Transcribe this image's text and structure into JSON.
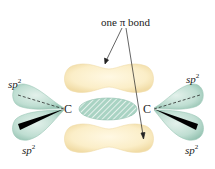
{
  "diagram": {
    "title_label": "one π bond",
    "atoms": {
      "left": "C",
      "right": "C"
    },
    "hybrid_labels": [
      {
        "id": "left-top",
        "base": "sp",
        "superscript": "2"
      },
      {
        "id": "left-bottom",
        "base": "sp",
        "superscript": "2"
      },
      {
        "id": "right-top",
        "base": "sp",
        "superscript": "2"
      },
      {
        "id": "right-bottom",
        "base": "sp",
        "superscript": "2"
      }
    ],
    "components": {
      "pi_lobe_top": "π bond lobe (upper)",
      "pi_lobe_bottom": "π bond lobe (lower)",
      "sigma_bond": "σ bond (hatched)",
      "left_sp2_orbitals": "sp2 hybrid orbitals on left carbon",
      "right_sp2_orbitals": "sp2 hybrid orbitals on right carbon"
    },
    "colors": {
      "pi_lobe": "#fbeec8",
      "pi_lobe_edge": "#f3dfae",
      "sp2_lobe": "#bfded2",
      "sp2_lobe_edge": "#9cc7b7",
      "sigma_fill": "#a9d3c3",
      "sigma_hatch": "#ffffff",
      "arrow": "#222222",
      "wedge": "#000000"
    }
  }
}
